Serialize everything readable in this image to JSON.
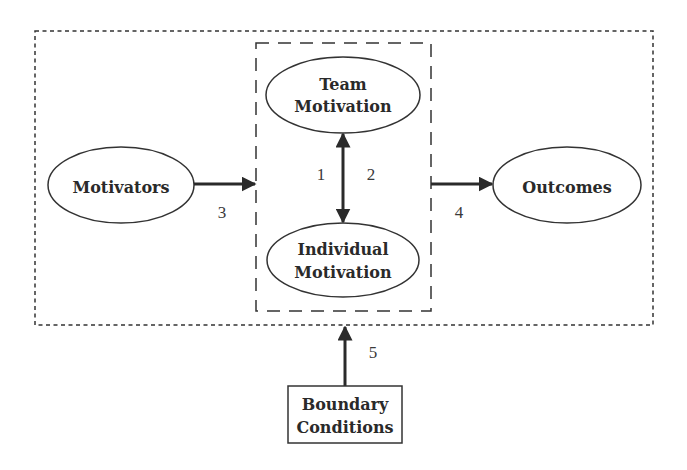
{
  "diagram": {
    "nodes": {
      "motivators": {
        "label": "Motivators",
        "shape": "ellipse"
      },
      "team_motivation": {
        "line1": "Team",
        "line2": "Motivation",
        "shape": "ellipse"
      },
      "individual_motivation": {
        "line1": "Individual",
        "line2": "Motivation",
        "shape": "ellipse"
      },
      "outcomes": {
        "label": "Outcomes",
        "shape": "ellipse"
      },
      "boundary_conditions": {
        "line1": "Boundary",
        "line2": "Conditions",
        "shape": "rectangle"
      }
    },
    "containers": {
      "outer": {
        "style": "dotted",
        "contains": [
          "motivators",
          "inner",
          "outcomes"
        ]
      },
      "inner": {
        "style": "dashed",
        "contains": [
          "team_motivation",
          "individual_motivation"
        ]
      }
    },
    "edges": [
      {
        "id": "1",
        "label": "1",
        "from": "team_motivation",
        "to": "individual_motivation",
        "bidirectional": true
      },
      {
        "id": "2",
        "label": "2",
        "from": "individual_motivation",
        "to": "team_motivation",
        "bidirectional": true
      },
      {
        "id": "3",
        "label": "3",
        "from": "motivators",
        "to": "inner"
      },
      {
        "id": "4",
        "label": "4",
        "from": "inner",
        "to": "outcomes"
      },
      {
        "id": "5",
        "label": "5",
        "from": "boundary_conditions",
        "to": "outer"
      }
    ],
    "colors": {
      "stroke": "#333333",
      "text": "#2a2a2a",
      "background": "#ffffff"
    }
  }
}
